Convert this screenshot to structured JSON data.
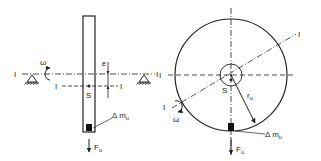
{
  "left_view": {
    "axis_label_left": "I",
    "axis_label_right": "I",
    "offset_axis_label_left": "I",
    "offset_axis_label_right": "I",
    "omega_label": "ω",
    "eccentricity_label": "e",
    "center_of_mass_label": "S",
    "mass_label_base": "Δ m",
    "mass_label_sub": "u",
    "force_label_base": "F",
    "force_label_sub": "u"
  },
  "right_view": {
    "axis_label_upper": "I",
    "axis_label_lower": "I",
    "horizontal_axis_label": "I",
    "omega_label": "ω",
    "center_of_mass_label": "S",
    "radius_label_base": "r",
    "radius_label_sub": "u",
    "mass_label_base": "Δ m",
    "mass_label_sub": "u",
    "force_label_base": "F",
    "force_label_sub": "u"
  },
  "colors": {
    "stroke": "#222222",
    "background": "#ffffff"
  }
}
